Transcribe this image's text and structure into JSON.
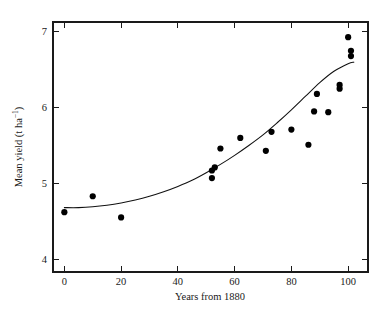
{
  "chart_data": {
    "type": "scatter",
    "title": "",
    "xlabel": "Years from 1880",
    "ylabel": "Mean yield (t ha⁻¹)",
    "ylabel_base": "Mean yield (t ha",
    "ylabel_exponent": "−1",
    "ylabel_close": ")",
    "xlim": [
      -4,
      107
    ],
    "ylim": [
      3.83,
      7.13
    ],
    "xticks": [
      0,
      20,
      40,
      60,
      80,
      100
    ],
    "yticks": [
      4,
      5,
      6,
      7
    ],
    "xtick_labels": [
      "0",
      "20",
      "40",
      "60",
      "80",
      "100"
    ],
    "ytick_labels": [
      "4",
      "5",
      "6",
      "7"
    ],
    "grid": false,
    "legend": false,
    "frame": "box",
    "tick_direction": "in",
    "marker": "filled-circle",
    "marker_color": "#000000",
    "curve_color": "#111111",
    "points": [
      {
        "x": 0,
        "y": 4.62
      },
      {
        "x": 10,
        "y": 4.83
      },
      {
        "x": 20,
        "y": 4.55
      },
      {
        "x": 52,
        "y": 5.17
      },
      {
        "x": 52,
        "y": 5.07
      },
      {
        "x": 53,
        "y": 5.21
      },
      {
        "x": 55,
        "y": 5.46
      },
      {
        "x": 62,
        "y": 5.6
      },
      {
        "x": 71,
        "y": 5.43
      },
      {
        "x": 73,
        "y": 5.68
      },
      {
        "x": 80,
        "y": 5.71
      },
      {
        "x": 86,
        "y": 5.51
      },
      {
        "x": 88,
        "y": 5.95
      },
      {
        "x": 89,
        "y": 6.18
      },
      {
        "x": 93,
        "y": 5.94
      },
      {
        "x": 97,
        "y": 6.3
      },
      {
        "x": 97,
        "y": 6.25
      },
      {
        "x": 100,
        "y": 6.93
      },
      {
        "x": 101,
        "y": 6.75
      },
      {
        "x": 101,
        "y": 6.68
      }
    ],
    "fit_curve": {
      "label": "fitted exponential trend",
      "x": [
        0,
        5,
        10,
        15,
        20,
        25,
        30,
        35,
        40,
        45,
        50,
        55,
        60,
        65,
        70,
        75,
        80,
        85,
        90,
        95,
        100,
        102
      ],
      "y": [
        4.68,
        4.68,
        4.69,
        4.71,
        4.74,
        4.78,
        4.83,
        4.89,
        4.96,
        5.04,
        5.14,
        5.25,
        5.37,
        5.5,
        5.64,
        5.8,
        5.97,
        6.15,
        6.33,
        6.48,
        6.58,
        6.6
      ]
    }
  },
  "geometry": {
    "plot_left": 53,
    "plot_right": 368,
    "plot_top": 22,
    "plot_bottom": 272
  }
}
